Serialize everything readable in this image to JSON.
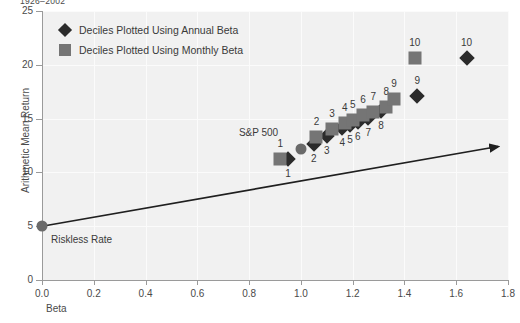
{
  "top_caption": "1926–2002",
  "axes": {
    "xlabel": "Beta",
    "ylabel": "Arithmetic Mean Return",
    "xticks": [
      "0.0",
      "0.2",
      "0.4",
      "0.6",
      "0.8",
      "1.0",
      "1.2",
      "1.4",
      "1.6",
      "1.8"
    ],
    "yticks": [
      "0",
      "5",
      "10",
      "15",
      "20",
      "25"
    ]
  },
  "legend": {
    "items": [
      {
        "label": "Deciles Plotted Using Annual Beta",
        "marker": "diamond",
        "color": "#2b2b2b"
      },
      {
        "label": "Deciles Plotted Using Monthly Beta",
        "marker": "square",
        "color": "#757575"
      }
    ]
  },
  "annotations": {
    "riskless_rate": "Riskless Rate",
    "sp500": "S&P 500"
  },
  "chart_data": {
    "type": "scatter",
    "title": "1926–2002",
    "xlabel": "Beta",
    "ylabel": "Arithmetic Mean Return",
    "xlim": [
      0.0,
      1.8
    ],
    "ylim": [
      0,
      25
    ],
    "xticks": [
      0.0,
      0.2,
      0.4,
      0.6,
      0.8,
      1.0,
      1.2,
      1.4,
      1.6,
      1.8
    ],
    "yticks": [
      0,
      5,
      10,
      15,
      20,
      25
    ],
    "grid": true,
    "legend_position": "upper-left",
    "series": [
      {
        "name": "Deciles Plotted Using Annual Beta",
        "marker": "diamond",
        "color": "#2b2b2b",
        "points": [
          {
            "label": "1",
            "x": 0.95,
            "y": 11.2,
            "label_pos": "below"
          },
          {
            "label": "2",
            "x": 1.05,
            "y": 12.6,
            "label_pos": "below"
          },
          {
            "label": "3",
            "x": 1.1,
            "y": 13.4,
            "label_pos": "below"
          },
          {
            "label": "4",
            "x": 1.16,
            "y": 14.1,
            "label_pos": "below"
          },
          {
            "label": "5",
            "x": 1.19,
            "y": 14.4,
            "label_pos": "below"
          },
          {
            "label": "6",
            "x": 1.22,
            "y": 14.7,
            "label_pos": "below"
          },
          {
            "label": "7",
            "x": 1.26,
            "y": 15.1,
            "label_pos": "below"
          },
          {
            "label": "8",
            "x": 1.31,
            "y": 15.7,
            "label_pos": "below"
          },
          {
            "label": "9",
            "x": 1.45,
            "y": 17.1,
            "label_pos": "above"
          },
          {
            "label": "10",
            "x": 1.64,
            "y": 20.6,
            "label_pos": "above"
          }
        ]
      },
      {
        "name": "Deciles Plotted Using Monthly Beta",
        "marker": "square",
        "color": "#757575",
        "points": [
          {
            "label": "1",
            "x": 0.92,
            "y": 11.2,
            "label_pos": "above"
          },
          {
            "label": "2",
            "x": 1.06,
            "y": 13.3,
            "label_pos": "above"
          },
          {
            "label": "3",
            "x": 1.12,
            "y": 14.0,
            "label_pos": "above"
          },
          {
            "label": "4",
            "x": 1.17,
            "y": 14.6,
            "label_pos": "above"
          },
          {
            "label": "5",
            "x": 1.2,
            "y": 14.9,
            "label_pos": "above"
          },
          {
            "label": "6",
            "x": 1.24,
            "y": 15.3,
            "label_pos": "above"
          },
          {
            "label": "7",
            "x": 1.28,
            "y": 15.6,
            "label_pos": "above"
          },
          {
            "label": "8",
            "x": 1.33,
            "y": 16.1,
            "label_pos": "above"
          },
          {
            "label": "9",
            "x": 1.36,
            "y": 16.8,
            "label_pos": "above"
          },
          {
            "label": "10",
            "x": 1.44,
            "y": 20.6,
            "label_pos": "above"
          }
        ]
      }
    ],
    "special_points": [
      {
        "name": "Riskless Rate",
        "x": 0.0,
        "y": 5.0,
        "marker": "circle",
        "color": "#6a6a6a",
        "label_pos": "below-right"
      },
      {
        "name": "S&P 500",
        "x": 1.0,
        "y": 12.2,
        "marker": "circle",
        "color": "#6a6a6a",
        "label_pos": "above-left"
      }
    ],
    "line": {
      "name": "Security Market Line",
      "from": {
        "x": 0.0,
        "y": 5.0
      },
      "to": {
        "x": 1.8,
        "y": 12.4
      },
      "arrow": true,
      "color": "#1f1f1f"
    }
  }
}
